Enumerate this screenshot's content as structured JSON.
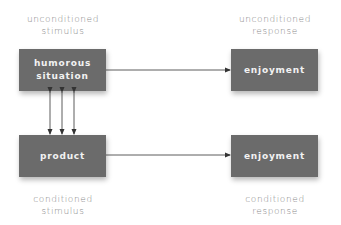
{
  "diagram": {
    "title": "",
    "nodes": [
      {
        "id": "us",
        "label": "humorous situation",
        "line1": "humorous",
        "line2": "situation",
        "caption1": "unconditioned",
        "caption2": "stimulus"
      },
      {
        "id": "ur",
        "label": "enjoyment",
        "caption1": "unconditioned",
        "caption2": "response"
      },
      {
        "id": "cs",
        "label": "product",
        "caption1": "conditioned",
        "caption2": "stimulus"
      },
      {
        "id": "cr",
        "label": "enjoyment",
        "caption1": "conditioned",
        "caption2": "response"
      }
    ],
    "edges": [
      {
        "from": "us",
        "to": "ur",
        "type": "arrow"
      },
      {
        "from": "cs",
        "to": "cr",
        "type": "arrow"
      },
      {
        "from": "us",
        "to": "cs",
        "type": "double-arrow",
        "count": 3
      }
    ],
    "colors": {
      "box": "#6b6b6b",
      "box_text": "#f2f2f2",
      "caption": "#8a8a8a",
      "line": "#333333"
    }
  }
}
